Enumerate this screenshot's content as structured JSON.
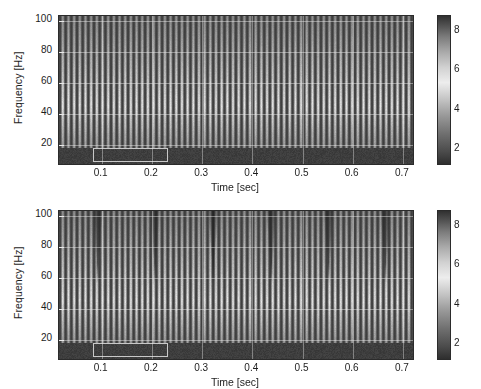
{
  "figure": {
    "type": "spectrogram-pair",
    "panels": [
      {
        "id": "top",
        "ylabel": "Frequency [Hz]",
        "xlabel": "Time [sec]",
        "yticks": [
          "100",
          "80",
          "60",
          "40",
          "20"
        ],
        "ytick_values": [
          100,
          80,
          60,
          40,
          20
        ],
        "xticks": [
          "0.1",
          "0.2",
          "0.3",
          "0.4",
          "0.5",
          "0.6",
          "0.7"
        ],
        "xtick_values": [
          0.1,
          0.2,
          0.3,
          0.4,
          0.5,
          0.6,
          0.7
        ],
        "colorbar_ticks": [
          "8",
          "6",
          "4",
          "2"
        ],
        "colorbar_values": [
          8,
          6,
          4,
          2
        ]
      },
      {
        "id": "bottom",
        "ylabel": "Frequency [Hz]",
        "xlabel": "Time [sec]",
        "yticks": [
          "100",
          "80",
          "60",
          "40",
          "20"
        ],
        "ytick_values": [
          100,
          80,
          60,
          40,
          20
        ],
        "xticks": [
          "0.1",
          "0.2",
          "0.3",
          "0.4",
          "0.5",
          "0.6",
          "0.7"
        ],
        "xtick_values": [
          0.1,
          0.2,
          0.3,
          0.4,
          0.5,
          0.6,
          0.7
        ],
        "colorbar_ticks": [
          "8",
          "6",
          "4",
          "2"
        ],
        "colorbar_values": [
          8,
          6,
          4,
          2
        ]
      }
    ]
  },
  "chart_data": [
    {
      "type": "heatmap",
      "id": "spectrogram-top",
      "title": "",
      "xlabel": "Time [sec]",
      "ylabel": "Frequency [Hz]",
      "xlim": [
        0.015,
        0.72
      ],
      "ylim": [
        8,
        103
      ],
      "xticks": [
        0.1,
        0.2,
        0.3,
        0.4,
        0.5,
        0.6,
        0.7
      ],
      "yticks": [
        20,
        40,
        60,
        80,
        100
      ],
      "grid": true,
      "colormap": "gray",
      "colorbar": {
        "ticks": [
          2,
          4,
          6,
          8
        ],
        "range": [
          1.3,
          8.8
        ],
        "position": "right",
        "orientation": "vertical"
      },
      "structure": {
        "description": "Broadband vertical harmonic striations repeating at a near-constant pulse rate across the whole record; energy maximal near 35-55 Hz, decaying toward 100 Hz; a uniformly dark low-energy band below ~18 Hz.",
        "stripe_count": 62,
        "stripe_period_sec": 0.0113,
        "energy_peak_hz": 45,
        "dark_band_below_hz": 18,
        "notches": []
      },
      "annotations": [
        {
          "type": "rectangle",
          "color": "#c8c8c8",
          "x0": 0.083,
          "x1": 0.232,
          "y0": 9.5,
          "y1": 18.5
        }
      ]
    },
    {
      "type": "heatmap",
      "id": "spectrogram-bottom",
      "title": "",
      "xlabel": "Time [sec]",
      "ylabel": "Frequency [Hz]",
      "xlim": [
        0.015,
        0.72
      ],
      "ylim": [
        8,
        103
      ],
      "xticks": [
        0.1,
        0.2,
        0.3,
        0.4,
        0.5,
        0.6,
        0.7
      ],
      "yticks": [
        20,
        40,
        60,
        80,
        100
      ],
      "grid": true,
      "colormap": "gray",
      "colorbar": {
        "ticks": [
          2,
          4,
          6,
          8
        ],
        "range": [
          1.3,
          8.8
        ],
        "position": "right",
        "orientation": "vertical"
      },
      "structure": {
        "description": "Same broadband harmonic striation pattern as the upper panel, but with periodic dark V-shaped spectral notches centred near 72 Hz recurring about every 0.115 s, and a uniformly dark band below ~18 Hz.",
        "stripe_count": 62,
        "stripe_period_sec": 0.0113,
        "energy_peak_hz": 45,
        "dark_band_below_hz": 18,
        "notches": [
          {
            "time_sec": 0.092,
            "center_hz": 72,
            "shape": "V"
          },
          {
            "time_sec": 0.206,
            "center_hz": 72,
            "shape": "V"
          },
          {
            "time_sec": 0.322,
            "center_hz": 72,
            "shape": "V"
          },
          {
            "time_sec": 0.438,
            "center_hz": 72,
            "shape": "V"
          },
          {
            "time_sec": 0.552,
            "center_hz": 72,
            "shape": "V"
          },
          {
            "time_sec": 0.665,
            "center_hz": 72,
            "shape": "V"
          }
        ]
      },
      "annotations": [
        {
          "type": "rectangle",
          "color": "#c8c8c8",
          "x0": 0.083,
          "x1": 0.232,
          "y0": 9.5,
          "y1": 18.5
        }
      ]
    }
  ]
}
